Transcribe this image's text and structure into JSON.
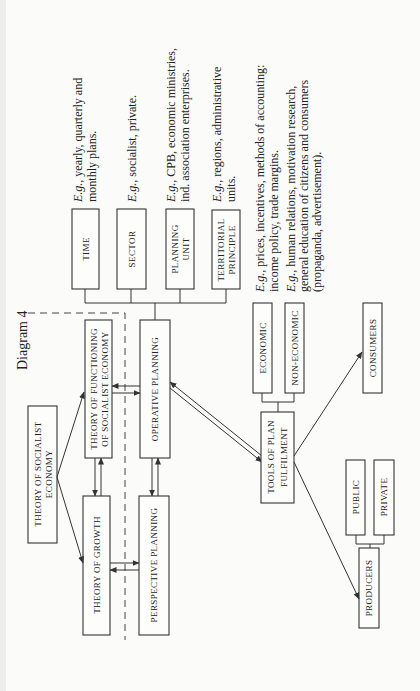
{
  "diagram": {
    "title": "Diagram 4",
    "orientation": "rotated-90-ccw",
    "boxes": {
      "theory_socialist_economy": [
        "THEORY OF SOCIALIST",
        "ECONOMY"
      ],
      "theory_functioning": [
        "THEORY OF FUNCTIONING",
        "OF SOCIALIST ECONOMY"
      ],
      "theory_growth": "THEORY OF GROWTH",
      "operative_planning": "OPERATIVE PLANNING",
      "perspective_planning": "PERSPECTIVE PLANNING",
      "time": "TIME",
      "sector": "SECTOR",
      "planning_unit": [
        "PLANNING",
        "UNIT"
      ],
      "territorial_principle": [
        "TERRITORIAL",
        "PRINCIPLE"
      ],
      "tools_plan_fulfilment": [
        "TOOLS OF PLAN",
        "FULFILMENT"
      ],
      "economic": "ECONOMIC",
      "non_economic": "NON-ECONOMIC",
      "consumers": "CONSUMERS",
      "producers": "PRODUCERS",
      "public": "PUBLIC",
      "private": "PRIVATE"
    },
    "notes": {
      "time": {
        "eg": "E.g.",
        "lines": [
          ", yearly, quarterly and",
          "monthly plans."
        ]
      },
      "sector": {
        "eg": "E.g.",
        "lines": [
          ", socialist, private."
        ]
      },
      "planning_unit": {
        "eg": "E.g.",
        "lines": [
          ", CPB, economic ministries,",
          "ind. association enterprises."
        ]
      },
      "territorial": {
        "eg": "E.g.",
        "lines": [
          ", regions, administrative",
          "units."
        ]
      },
      "economic": {
        "eg": "E.g.",
        "lines": [
          ", prices, incentives, methods of  accounting:",
          "income policy, trade margins."
        ]
      },
      "non_economic": {
        "eg": "E.g.",
        "lines": [
          ", human relations, motivation research,",
          "general education of citizens and consumers",
          "(propaganda, advertisement)."
        ]
      }
    }
  }
}
